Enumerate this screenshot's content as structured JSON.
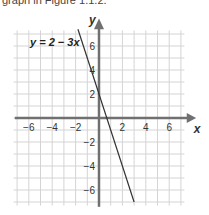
{
  "caption": "graph in Figure 1.1.2.",
  "chart_data": {
    "type": "line",
    "title": "",
    "xlabel": "x",
    "ylabel": "y",
    "xlim": [
      -7,
      7
    ],
    "ylim": [
      -7,
      7
    ],
    "grid": true,
    "x_ticks": [
      -6,
      -4,
      -2,
      2,
      4,
      6
    ],
    "y_ticks": [
      6,
      4,
      2,
      -2,
      -4,
      -6
    ],
    "x_tick_labels": [
      "−6",
      "−4",
      "−2",
      "2",
      "4",
      "6"
    ],
    "y_tick_labels": [
      "6",
      "4",
      "2",
      "−2",
      "−4",
      "−6"
    ],
    "series": [
      {
        "name": "y = 2 − 3x",
        "equation": "y = 2 − 3x",
        "x": [
          -1.8,
          3.0
        ],
        "y": [
          7.4,
          -7.0
        ]
      }
    ],
    "annotations": [
      {
        "text": "y = 2 − 3x",
        "near": [
          -4.5,
          6.5
        ]
      }
    ],
    "colors": {
      "grid": "#d4d4d4",
      "axis": "#707070",
      "line": "#333333"
    }
  }
}
